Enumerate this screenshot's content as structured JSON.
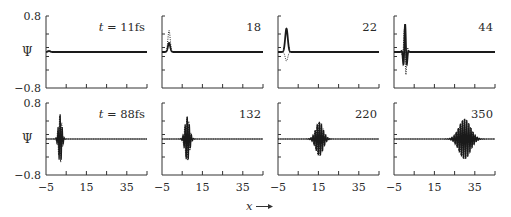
{
  "chart_data": {
    "type": "line",
    "title": "",
    "layout": {
      "rows": 2,
      "cols": 4,
      "shared_x": true,
      "shared_y": true,
      "grid": false
    },
    "xlabel": "x",
    "xlabel_arrow": "→",
    "ylabel": "Ψ",
    "xlim": [
      -5,
      45
    ],
    "ylim": [
      -0.8,
      0.8
    ],
    "x_ticks": [
      -5,
      5,
      15,
      25,
      35,
      45
    ],
    "x_tick_labels": [
      "-5",
      "15",
      "35"
    ],
    "x_tick_labels_display": [
      "−5",
      "15",
      "35"
    ],
    "y_tick_labels": [
      "0.8",
      "−0.8"
    ],
    "y_ticks": [
      -0.8,
      -0.4,
      -0.1,
      0.1,
      0.4,
      0.8
    ],
    "series_legend": [
      {
        "name": "Re Ψ",
        "style": "solid"
      },
      {
        "name": "Im Ψ",
        "style": "dotted"
      }
    ],
    "panels": [
      {
        "label": "t = 11fs",
        "t_fs": 11,
        "row": 0,
        "col": 0,
        "center": -3.5,
        "width": 0.8,
        "amp_solid": 0.02,
        "amp_dotted": 0.05,
        "k": 0,
        "kind": "bump"
      },
      {
        "label": "18",
        "t_fs": 18,
        "row": 0,
        "col": 1,
        "center": -1.5,
        "width": 0.8,
        "amp_solid": 0.2,
        "amp_dotted": 0.48,
        "k": 0,
        "kind": "bump"
      },
      {
        "label": "22",
        "t_fs": 22,
        "row": 0,
        "col": 2,
        "center": -0.8,
        "width": 0.9,
        "amp_solid": 0.52,
        "amp_dotted": -0.2,
        "k": 0,
        "kind": "bump"
      },
      {
        "label": "44",
        "t_fs": 44,
        "row": 0,
        "col": 3,
        "center": 0.5,
        "width": 1.0,
        "amp_solid": 0.62,
        "amp_dotted": 0.62,
        "k": 3.2,
        "kind": "packet"
      },
      {
        "label": "t = 88fs",
        "t_fs": 88,
        "row": 1,
        "col": 0,
        "center": 2.0,
        "width": 1.2,
        "amp_solid": 0.55,
        "amp_dotted": 0.55,
        "k": 6.0,
        "kind": "packet"
      },
      {
        "label": "132",
        "t_fs": 132,
        "row": 1,
        "col": 1,
        "center": 7.5,
        "width": 1.6,
        "amp_solid": 0.5,
        "amp_dotted": 0.5,
        "k": 6.0,
        "kind": "packet"
      },
      {
        "label": "220",
        "t_fs": 220,
        "row": 1,
        "col": 2,
        "center": 15.5,
        "width": 2.6,
        "amp_solid": 0.38,
        "amp_dotted": 0.38,
        "k": 6.0,
        "kind": "packet"
      },
      {
        "label": "350",
        "t_fs": 350,
        "row": 1,
        "col": 3,
        "center": 30.0,
        "width": 4.0,
        "amp_solid": 0.45,
        "amp_dotted": 0.45,
        "k": 6.0,
        "kind": "packet"
      }
    ]
  }
}
